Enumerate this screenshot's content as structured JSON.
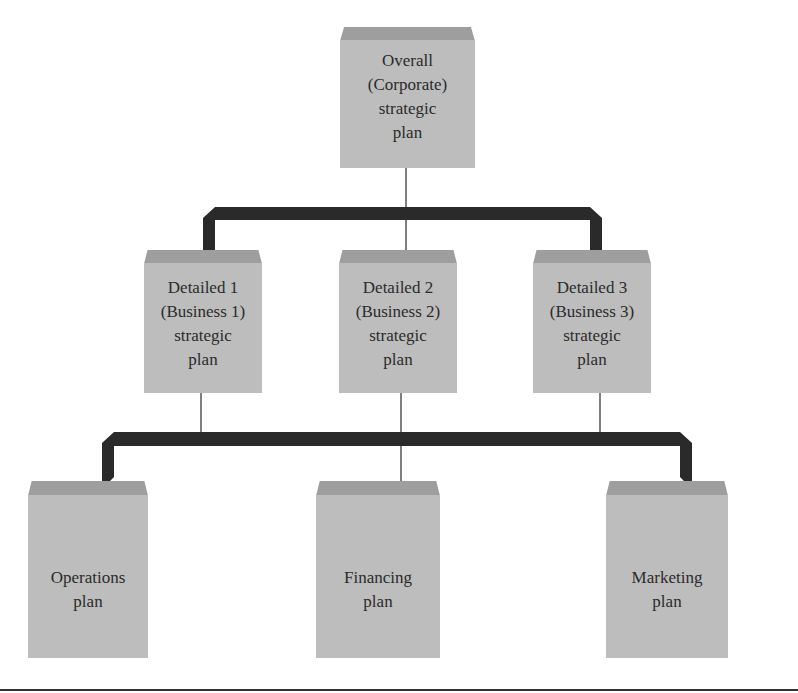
{
  "diagram": {
    "type": "hierarchy",
    "colors": {
      "box_body": "#bdbdbd",
      "box_cap": "#9e9e9e",
      "connector": "#2a2a2a",
      "text": "#2b2b2b"
    },
    "top": {
      "id": "overall",
      "label": "Overall\n(Corporate)\nstrategic\nplan"
    },
    "middle": [
      {
        "id": "detailed1",
        "label": "Detailed 1\n(Business 1)\nstrategic\nplan"
      },
      {
        "id": "detailed2",
        "label": "Detailed 2\n(Business 2)\nstrategic\nplan"
      },
      {
        "id": "detailed3",
        "label": "Detailed 3\n(Business 3)\nstrategic\nplan"
      }
    ],
    "bottom": [
      {
        "id": "operations",
        "label": "Operations\nplan"
      },
      {
        "id": "financing",
        "label": "Financing\nplan"
      },
      {
        "id": "marketing",
        "label": "Marketing\nplan"
      }
    ],
    "edges": [
      [
        "overall",
        "detailed1"
      ],
      [
        "overall",
        "detailed2"
      ],
      [
        "overall",
        "detailed3"
      ],
      [
        "detailed1",
        "operations"
      ],
      [
        "detailed2",
        "financing"
      ],
      [
        "detailed3",
        "marketing"
      ],
      [
        "detailed1",
        "financing"
      ],
      [
        "detailed3",
        "financing"
      ]
    ]
  }
}
